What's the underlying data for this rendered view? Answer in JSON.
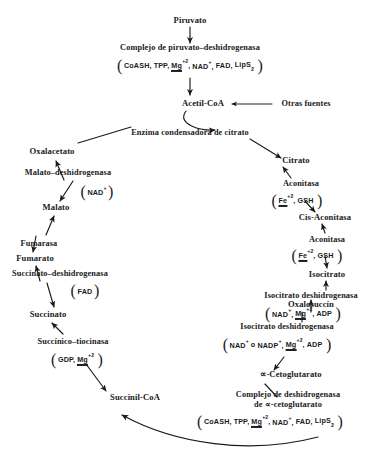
{
  "diagram": {
    "ink_color": "#1a1a1a",
    "background": "#ffffff"
  },
  "metabolites": {
    "piruvato": "Piruvato",
    "acetil_coa": "Acetil-CoA",
    "otras_fuentes": "Otras fuentes",
    "oxalacetato": "Oxalacetato",
    "malato": "Malato",
    "fumarato": "Fumarato",
    "succinato": "Succinato",
    "succinil_coa": "Succinil-CoA",
    "citrato": "Citrato",
    "cis_aconitasa": "Cis-Aconitasa",
    "isocitrato": "Isocitrato",
    "oxalosuccin": "Oxalosuccín",
    "cetoglutarato": "∝-Cetoglutarato"
  },
  "enzymes": {
    "piruvato_deshidrogenasa": "Complejo de piruvato–deshidrogenasa",
    "enzima_condensadora": "Enzima condensadora de citrato",
    "malato_deshidrogenasa": "Malato–deshidrogenasa",
    "fumarasa": "Fumarasa",
    "succinato_deshidrogenasa": "Succinato–deshidrogenasa",
    "succinico_tiocinasa": "Succínico–tiocinasa",
    "aconitasa_1": "Aconitasa",
    "aconitasa_2": "Aconitasa",
    "isocitrato_deshidrogenasa_1": "Isocitrato deshidrogenasa",
    "isocitrato_deshidrogenasa_2": "Isocitrato deshidrogenasa",
    "cetoglutarato_complejo_line1": "Complejo de deshidrogenasa",
    "cetoglutarato_complejo_line2": "de ∝-cetoglutarato"
  },
  "cofactors": {
    "pdh": {
      "items": [
        "CoASH,",
        "TPP,",
        "Mg",
        "NAD",
        "FAD,",
        "LipS"
      ],
      "display": "( CoASH, TPP, Mg+2, NAD+, FAD, LipS2 )"
    },
    "mdh": {
      "display": "( NAD+ )"
    },
    "aconitasa_1": {
      "display": "( Fe+2, GSH )"
    },
    "aconitasa_2": {
      "display": "( Fe+2, GSH )"
    },
    "sdh": {
      "display": "( FAD )"
    },
    "stk": {
      "display": "( GDP, Mg+2 )"
    },
    "idh_1": {
      "display": "( NAD+, Mg+2, ADP )"
    },
    "idh_2": {
      "display": "( NAD+ o NADP+, Mg+2, ADP )"
    },
    "kgdh": {
      "display": "( CoASH, TPP, Mg+2, NAD+, FAD, LipS2 )"
    }
  },
  "labels": {
    "coash": "CoASH,",
    "tpp": "TPP,",
    "mg": "Mg",
    "mg_charge": "+2",
    "nad": "NAD",
    "nad_charge": "+",
    "nadp": "NADP",
    "nadp_charge": "+",
    "fad": "FAD,",
    "fad_plain": "FAD",
    "lips": "LipS",
    "lips_sub": "2",
    "fe": "Fe",
    "fe_charge": "+2",
    "gsh": "GSH",
    "gdp": "GDP,",
    "adp": "ADP",
    "o_conj": "o",
    "comma": ",",
    "nad_comma": "NAD"
  }
}
